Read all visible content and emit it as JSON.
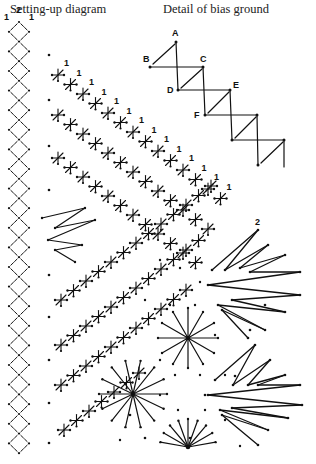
{
  "titles": {
    "left": "Setting-up diagram",
    "right": "Detail of bias ground"
  },
  "detail_labels": [
    "A",
    "B",
    "C",
    "D",
    "E",
    "F"
  ],
  "pair_labels": {
    "top_left": [
      "1",
      "2",
      "1"
    ],
    "diagonal_ones": "1",
    "right_two": "2"
  },
  "colors": {
    "ink": "#111111",
    "background": "#ffffff"
  }
}
